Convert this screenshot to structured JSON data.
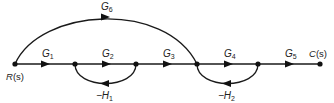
{
  "diagram": {
    "type": "signal-flow-graph",
    "nodes": [
      {
        "id": "n1",
        "label": "R(s)",
        "label_main": "R",
        "label_paren": "(s)",
        "x": 15,
        "y": 64
      },
      {
        "id": "n2",
        "label": "",
        "x": 75,
        "y": 64
      },
      {
        "id": "n3",
        "label": "",
        "x": 136,
        "y": 64
      },
      {
        "id": "n4",
        "label": "",
        "x": 197,
        "y": 64
      },
      {
        "id": "n5",
        "label": "",
        "x": 258,
        "y": 64
      },
      {
        "id": "n6",
        "label": "C(s)",
        "label_main": "C",
        "label_paren": "(s)",
        "x": 320,
        "y": 64
      }
    ],
    "branches": [
      {
        "from": "n1",
        "to": "n2",
        "gain": "G1",
        "main": "G",
        "sub": "1"
      },
      {
        "from": "n2",
        "to": "n3",
        "gain": "G2",
        "main": "G",
        "sub": "2"
      },
      {
        "from": "n3",
        "to": "n4",
        "gain": "G3",
        "main": "G",
        "sub": "3"
      },
      {
        "from": "n4",
        "to": "n5",
        "gain": "G4",
        "main": "G",
        "sub": "4"
      },
      {
        "from": "n5",
        "to": "n6",
        "gain": "G5",
        "main": "G",
        "sub": "5"
      },
      {
        "from": "n1",
        "to": "n4",
        "gain": "G6",
        "main": "G",
        "sub": "6",
        "kind": "feedforward-arc"
      },
      {
        "from": "n3",
        "to": "n2",
        "gain": "-H1",
        "main": "−H",
        "sub": "1",
        "kind": "feedback-loop"
      },
      {
        "from": "n5",
        "to": "n4",
        "gain": "-H2",
        "main": "−H",
        "sub": "2",
        "kind": "feedback-loop"
      }
    ]
  }
}
